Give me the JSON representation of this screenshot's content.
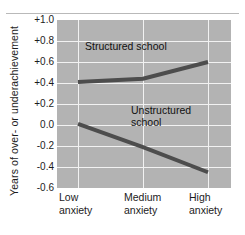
{
  "chart_data": {
    "type": "line",
    "title": "",
    "subtitle": "",
    "xlabel": "",
    "ylabel": "Years of over- or underachievement",
    "categories": [
      "Low anxiety",
      "Medium anxiety",
      "High anxiety"
    ],
    "category_lines": [
      [
        "Low",
        "anxiety"
      ],
      [
        "Medium",
        "anxiety"
      ],
      [
        "High",
        "anxiety"
      ]
    ],
    "ylim": [
      -0.6,
      1.0
    ],
    "yticks": [
      "+1.0",
      "+0.8",
      "+0.6",
      "+0.4",
      "+0.2",
      "0.0",
      "-0.2",
      "-0.4",
      "-0.6"
    ],
    "ytick_values": [
      1.0,
      0.8,
      0.6,
      0.4,
      0.2,
      0.0,
      -0.2,
      -0.4,
      -0.6
    ],
    "grid": true,
    "grid_color": "#f2f2f2",
    "plot_background": "#b3b3b3",
    "line_color": "#4d4d4d",
    "legend_position": "inline-annotations",
    "series": [
      {
        "name": "Structured school",
        "values": [
          0.41,
          0.44,
          0.6
        ],
        "annotation": "Structured school"
      },
      {
        "name": "Unstructured school",
        "values": [
          0.01,
          -0.21,
          -0.45
        ],
        "annotation": "Unstructured\nschool"
      }
    ]
  },
  "annotations": {
    "structured": "Structured school",
    "unstructured": "Unstructured\nschool"
  }
}
